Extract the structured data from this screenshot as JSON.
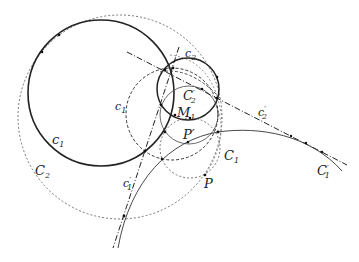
{
  "figure": {
    "type": "geometric-construction",
    "labels": {
      "c1": "c",
      "c1_sub": "1",
      "c1_dashed": "c",
      "c1_dashed_sub": "1",
      "C2": "C",
      "C2_sub": "2",
      "c2": "c",
      "c2_sub": "2",
      "C2p": "C",
      "C2p_sub": "2",
      "C2p_prime": "′",
      "M1": "M",
      "M1_sub": "1",
      "Pp": "P′",
      "C1": "C",
      "C1_sub": "1",
      "P": "P",
      "c1p": "c",
      "c1p_sub": "1",
      "c1p_prime": "′",
      "c2p": "c",
      "c2p_sub": "2",
      "c2p_prime": "′",
      "C1p": "C",
      "C1p_sub": "1",
      "C1p_prime": "′"
    },
    "colors": {
      "stroke": "#222222",
      "background": "#ffffff"
    }
  }
}
